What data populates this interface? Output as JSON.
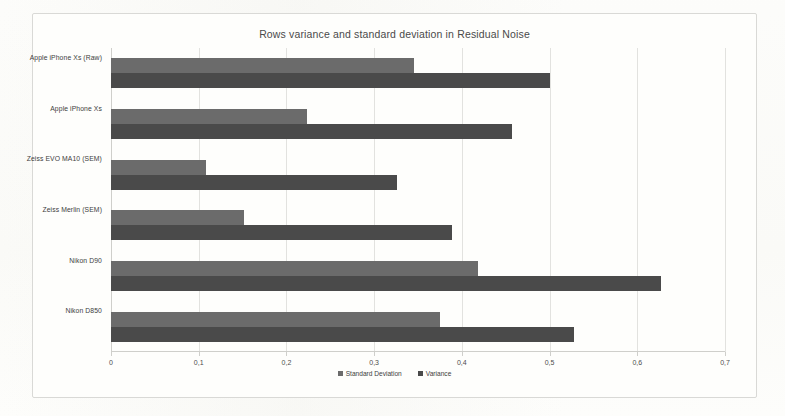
{
  "chart_data": {
    "type": "bar",
    "orientation": "horizontal",
    "title": "Rows variance and standard deviation in Residual Noise",
    "xlabel": "",
    "ylabel": "",
    "xlim": [
      0,
      0.7
    ],
    "xticks": [
      "0",
      "0,1",
      "0,2",
      "0,3",
      "0,4",
      "0,5",
      "0,6",
      "0,7"
    ],
    "xtick_values": [
      0,
      0.1,
      0.2,
      0.3,
      0.4,
      0.5,
      0.6,
      0.7
    ],
    "grid": true,
    "legend_position": "bottom",
    "categories": [
      "Apple iPhone Xs (Raw)",
      "Apple iPhone Xs",
      "Zeiss EVO MA10 (SEM)",
      "Zeiss Merlin (SEM)",
      "Nikon D90",
      "Nikon D850"
    ],
    "series": [
      {
        "name": "Standard Deviation",
        "color": "#6b6b6b",
        "values": [
          0.345,
          0.224,
          0.108,
          0.152,
          0.418,
          0.375
        ]
      },
      {
        "name": "Variance",
        "color": "#4a4a4a",
        "values": [
          0.5,
          0.457,
          0.326,
          0.389,
          0.627,
          0.528
        ]
      }
    ]
  },
  "legend": {
    "items": [
      {
        "label": "Standard Deviation",
        "color": "#6b6b6b"
      },
      {
        "label": "Variance",
        "color": "#4a4a4a"
      }
    ]
  }
}
